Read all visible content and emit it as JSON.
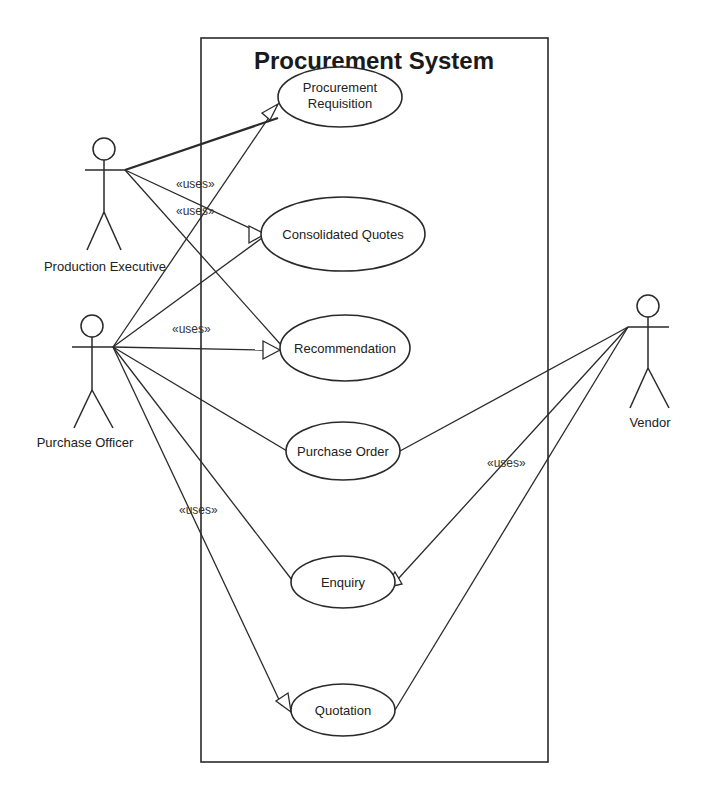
{
  "diagram": {
    "title": "Procurement System",
    "system_boundary": {
      "x": 201,
      "y": 38,
      "width": 347,
      "height": 724
    },
    "use_cases": [
      {
        "id": "procurement-requisition",
        "lines": [
          "Procurement",
          "Requisition"
        ],
        "cx": 340,
        "cy": 97,
        "rx": 62,
        "ry": 30
      },
      {
        "id": "consolidated-quotes",
        "lines": [
          "Consolidated Quotes"
        ],
        "cx": 343,
        "cy": 234,
        "rx": 82,
        "ry": 37
      },
      {
        "id": "recommendation",
        "lines": [
          "Recommendation"
        ],
        "cx": 345,
        "cy": 348,
        "rx": 65,
        "ry": 33
      },
      {
        "id": "purchase-order",
        "lines": [
          "Purchase Order"
        ],
        "cx": 343,
        "cy": 451,
        "rx": 57,
        "ry": 29
      },
      {
        "id": "enquiry",
        "lines": [
          "Enquiry"
        ],
        "cx": 343,
        "cy": 582,
        "rx": 52,
        "ry": 26
      },
      {
        "id": "quotation",
        "lines": [
          "Quotation"
        ],
        "cx": 343,
        "cy": 710,
        "rx": 52,
        "ry": 26
      }
    ],
    "actors": [
      {
        "id": "production-executive",
        "label": "Production Executive",
        "x": 103,
        "headY": 148
      },
      {
        "id": "purchase-officer",
        "label": "Purchase Officer",
        "x": 92,
        "headY": 326
      },
      {
        "id": "vendor",
        "label": "Vendor",
        "x": 648,
        "headY": 306
      }
    ],
    "stereotype": "«uses»",
    "stereotype_labels": [
      {
        "text": "«uses»",
        "x": 176,
        "y": 188
      },
      {
        "text": "«uses»",
        "x": 176,
        "y": 215
      },
      {
        "text": "«uses»",
        "x": 172,
        "y": 333
      },
      {
        "text": "«uses»",
        "x": 487,
        "y": 467
      },
      {
        "text": "«uses»",
        "x": 179,
        "y": 514
      }
    ],
    "caption_fragment": ""
  }
}
